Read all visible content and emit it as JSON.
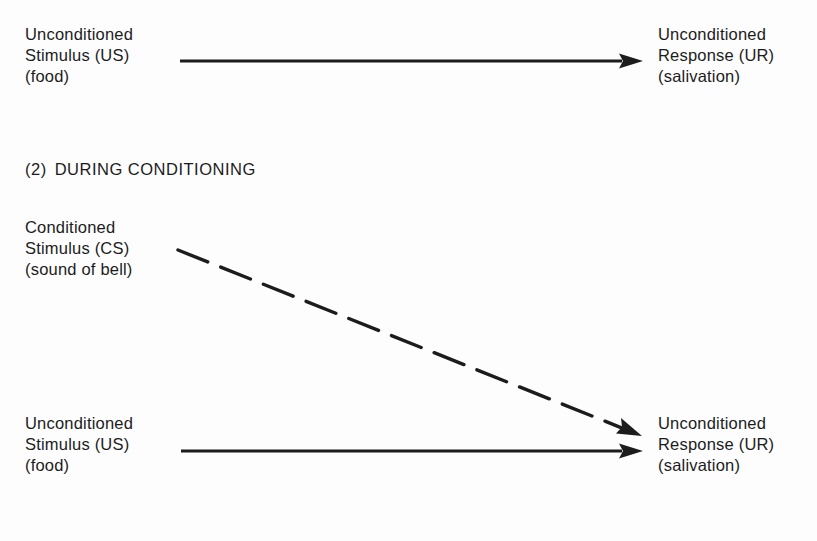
{
  "diagram": {
    "section1": {
      "stimulus": {
        "line1": "Unconditioned",
        "line2": "Stimulus (US)",
        "line3": "(food)"
      },
      "response": {
        "line1": "Unconditioned",
        "line2": "Response (UR)",
        "line3": "(salivation)"
      },
      "arrow": {
        "style": "solid",
        "from": [
          180,
          61
        ],
        "to": [
          643,
          61
        ]
      }
    },
    "section2": {
      "heading_number": "(2)",
      "heading_text": "DURING CONDITIONING",
      "conditioned_stimulus": {
        "line1": "Conditioned",
        "line2": "Stimulus (CS)",
        "line3": "(sound of bell)"
      },
      "unconditioned_stimulus": {
        "line1": "Unconditioned",
        "line2": "Stimulus (US)",
        "line3": "(food)"
      },
      "response": {
        "line1": "Unconditioned",
        "line2": "Response (UR)",
        "line3": "(salivation)"
      },
      "dashed_arrow": {
        "style": "dashed",
        "from": [
          178,
          250
        ],
        "to": [
          642,
          436
        ]
      },
      "solid_arrow": {
        "style": "solid",
        "from": [
          181,
          451
        ],
        "to": [
          643,
          451
        ]
      }
    },
    "colors": {
      "background": "#fdfdfd",
      "ink": "#1c1c1c"
    }
  }
}
